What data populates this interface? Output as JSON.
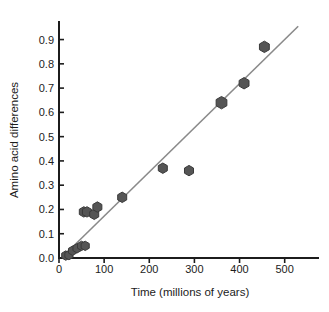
{
  "chart_data": {
    "type": "scatter",
    "title": "",
    "xlabel": "Time (millions of years)",
    "ylabel": "Amino acid differences",
    "xlim": [
      0,
      545
    ],
    "ylim": [
      0.0,
      0.96
    ],
    "grid": false,
    "legend": null,
    "xticks": [
      0,
      100,
      200,
      300,
      400,
      500
    ],
    "xtick_labels": [
      "0",
      "100",
      "200",
      "300",
      "400",
      "500"
    ],
    "yticks": [
      0.0,
      0.1,
      0.2,
      0.3,
      0.4,
      0.5,
      0.6,
      0.7,
      0.8,
      0.9
    ],
    "ytick_labels": [
      "0.0",
      "0.1",
      "0.2",
      "0.3",
      "0.4",
      "0.5",
      "0.6",
      "0.7",
      "0.8",
      "0.9"
    ],
    "marker_shape": "hexagon",
    "marker_color": "#555555",
    "marker_edge_color": "#3a3a3a",
    "trend_line_color": "#8a8a8a",
    "axis_color": "#1c1c1c",
    "series": [
      {
        "name": "Amino acid differences vs divergence time",
        "points": [
          {
            "x": 15,
            "y": 0.01,
            "size": 7
          },
          {
            "x": 22,
            "y": 0.012,
            "size": 7
          },
          {
            "x": 30,
            "y": 0.03,
            "size": 7
          },
          {
            "x": 40,
            "y": 0.04,
            "size": 7
          },
          {
            "x": 50,
            "y": 0.05,
            "size": 7
          },
          {
            "x": 58,
            "y": 0.05,
            "size": 7
          },
          {
            "x": 55,
            "y": 0.19,
            "size": 8
          },
          {
            "x": 62,
            "y": 0.19,
            "size": 8
          },
          {
            "x": 78,
            "y": 0.18,
            "size": 8
          },
          {
            "x": 85,
            "y": 0.21,
            "size": 8
          },
          {
            "x": 140,
            "y": 0.25,
            "size": 8
          },
          {
            "x": 230,
            "y": 0.37,
            "size": 8
          },
          {
            "x": 288,
            "y": 0.36,
            "size": 8
          },
          {
            "x": 360,
            "y": 0.64,
            "size": 10
          },
          {
            "x": 410,
            "y": 0.72,
            "size": 9
          },
          {
            "x": 455,
            "y": 0.87,
            "size": 9
          }
        ]
      }
    ],
    "trend_line": {
      "x_start": 8,
      "y_start": 0.005,
      "x_end": 530,
      "y_end": 0.955
    }
  }
}
